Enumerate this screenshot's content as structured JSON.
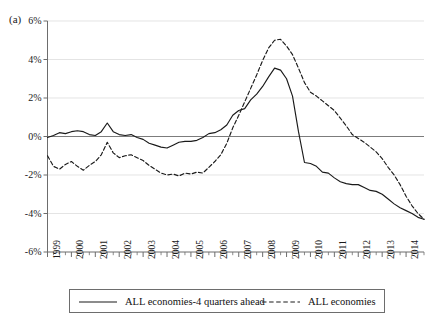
{
  "figure": {
    "panel_label": "(a)",
    "axis_color": "#6d6d6d",
    "grid_color": "#d8d8d8",
    "line_color": "#1a1a1a"
  },
  "legend": {
    "entries": [
      {
        "label": "ALL economies-4 quarters ahead",
        "style": "solid",
        "icon": "solid-line-swatch-icon"
      },
      {
        "label": "ALL economies",
        "style": "dashed",
        "icon": "dashed-line-swatch-icon"
      }
    ]
  },
  "chart_data": {
    "type": "line",
    "title": "",
    "xlabel": "",
    "ylabel": "",
    "xlim": [
      1999.0,
      2014.75
    ],
    "ylim": [
      -6,
      6
    ],
    "grid": true,
    "legend_position": "bottom",
    "ytick_labels": [
      "6%",
      "4%",
      "2%",
      "0%",
      "-2%",
      "-4%",
      "-6%"
    ],
    "ytick_values": [
      6,
      4,
      2,
      0,
      -2,
      -4,
      -6
    ],
    "xtick_labels": [
      "1999",
      "2000",
      "2001",
      "2002",
      "2003",
      "2004",
      "2005",
      "2006",
      "2007",
      "2008",
      "2009",
      "2010",
      "2011",
      "2012",
      "2013",
      "2014"
    ],
    "xtick_values": [
      1999,
      2000,
      2001,
      2002,
      2003,
      2004,
      2005,
      2006,
      2007,
      2008,
      2009,
      2010,
      2011,
      2012,
      2013,
      2014
    ],
    "minor_xticks_per_year": 4,
    "x": [
      1999.0,
      1999.25,
      1999.5,
      1999.75,
      2000.0,
      2000.25,
      2000.5,
      2000.75,
      2001.0,
      2001.25,
      2001.5,
      2001.75,
      2002.0,
      2002.25,
      2002.5,
      2002.75,
      2003.0,
      2003.25,
      2003.5,
      2003.75,
      2004.0,
      2004.25,
      2004.5,
      2004.75,
      2005.0,
      2005.25,
      2005.5,
      2005.75,
      2006.0,
      2006.25,
      2006.5,
      2006.75,
      2007.0,
      2007.25,
      2007.5,
      2007.75,
      2008.0,
      2008.25,
      2008.5,
      2008.75,
      2009.0,
      2009.25,
      2009.5,
      2009.75,
      2010.0,
      2010.25,
      2010.5,
      2010.75,
      2011.0,
      2011.25,
      2011.5,
      2011.75,
      2012.0,
      2012.25,
      2012.5,
      2012.75,
      2013.0,
      2013.25,
      2013.5,
      2013.75,
      2014.0,
      2014.25,
      2014.5,
      2014.75
    ],
    "series": [
      {
        "name": "ALL economies-4 quarters ahead",
        "style": "solid",
        "values": [
          -0.05,
          0.05,
          0.2,
          0.15,
          0.25,
          0.3,
          0.25,
          0.1,
          0.05,
          0.25,
          0.7,
          0.25,
          0.1,
          0.05,
          0.1,
          -0.05,
          -0.15,
          -0.35,
          -0.45,
          -0.55,
          -0.6,
          -0.45,
          -0.3,
          -0.25,
          -0.25,
          -0.2,
          -0.05,
          0.15,
          0.2,
          0.35,
          0.6,
          1.1,
          1.35,
          1.45,
          1.9,
          2.2,
          2.6,
          3.1,
          3.55,
          3.45,
          3.0,
          2.1,
          0.25,
          -1.35,
          -1.4,
          -1.55,
          -1.85,
          -1.9,
          -2.15,
          -2.35,
          -2.45,
          -2.5,
          -2.5,
          -2.65,
          -2.8,
          -2.85,
          -3.0,
          -3.25,
          -3.5,
          -3.7,
          -3.85,
          -4.0,
          -4.2,
          -4.3
        ]
      },
      {
        "name": "ALL economies",
        "style": "dashed",
        "values": [
          -1.0,
          -1.55,
          -1.7,
          -1.45,
          -1.3,
          -1.55,
          -1.75,
          -1.5,
          -1.3,
          -0.95,
          -0.3,
          -0.85,
          -1.1,
          -1.0,
          -0.95,
          -1.1,
          -1.25,
          -1.5,
          -1.7,
          -1.9,
          -2.0,
          -1.95,
          -2.05,
          -1.9,
          -1.95,
          -1.85,
          -1.9,
          -1.6,
          -1.3,
          -0.95,
          -0.35,
          0.45,
          1.1,
          1.8,
          2.5,
          3.2,
          3.95,
          4.6,
          5.0,
          5.05,
          4.7,
          4.25,
          3.55,
          2.8,
          2.3,
          2.1,
          1.85,
          1.6,
          1.35,
          0.95,
          0.55,
          0.1,
          -0.1,
          -0.3,
          -0.55,
          -0.8,
          -1.15,
          -1.6,
          -2.0,
          -2.5,
          -3.1,
          -3.6,
          -4.0,
          -4.3
        ]
      }
    ]
  }
}
